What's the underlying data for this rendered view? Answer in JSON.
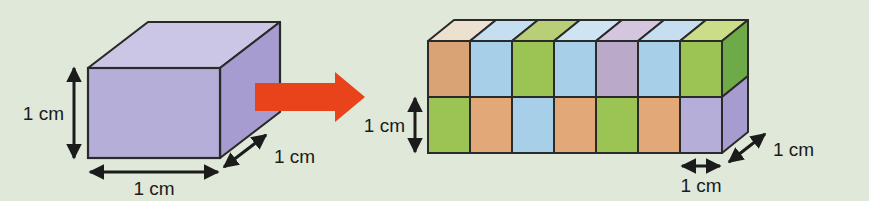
{
  "figure": {
    "background_color": "#dfe8d9",
    "edge_color": "#2a2a2a",
    "arrow_color": "#e8431a"
  },
  "unit_cube": {
    "name": "unit-cube",
    "front_face_color": "#b5aed8",
    "top_face_color": "#ccc6e6",
    "side_face_color": "#a79ccf",
    "labels": {
      "height": "1 cm",
      "width": "1 cm",
      "depth": "1 cm"
    }
  },
  "transform_arrow": {
    "name": "transform-arrow",
    "color": "#e8431a",
    "direction": "right"
  },
  "prism": {
    "name": "rectangular-prism",
    "columns": 7,
    "rows": 2,
    "depth_cubes": 1,
    "labels": {
      "height": "1 cm",
      "width": "1 cm",
      "depth": "1 cm"
    },
    "top_face_colors": [
      "#ece0cf",
      "#c5dff0",
      "#b8cf77",
      "#cfe4f2",
      "#d3c6de",
      "#c5dff0",
      "#cbdd87"
    ],
    "top_row_front_colors": [
      "#d9a376",
      "#a8cfe8",
      "#9cc455",
      "#a8cfe8",
      "#bba9c9",
      "#a8cfe8",
      "#9cc455"
    ],
    "bottom_row_front_colors": [
      "#9cc455",
      "#e2a878",
      "#a8cfe8",
      "#e2a878",
      "#9cc455",
      "#e2a878",
      "#b5aed8"
    ],
    "right_side_colors": {
      "top": "#6faa49",
      "bottom": "#a79ccf"
    }
  }
}
